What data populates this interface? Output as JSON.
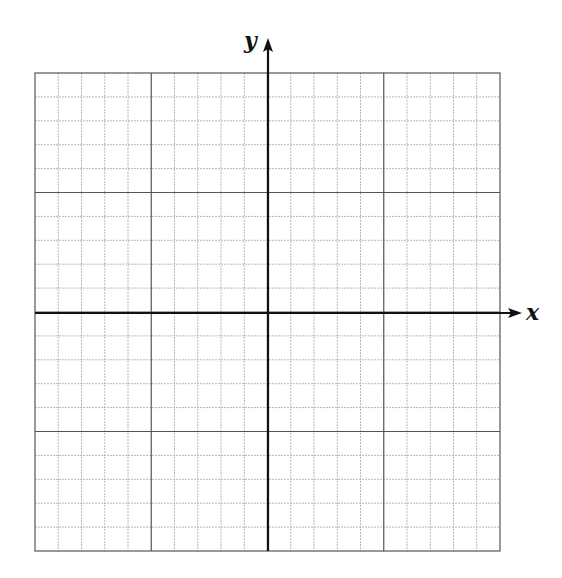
{
  "graph": {
    "x_label": "x",
    "y_label": "y",
    "grid": {
      "left": 35,
      "top": 73,
      "right": 500,
      "bottom": 551,
      "cells_x": 20,
      "cells_y": 20,
      "major_every": 5,
      "minor_color": "#b8b8b8",
      "major_color": "#555555",
      "axis_color": "#111111"
    },
    "origin": {
      "x": 268,
      "y": 313
    },
    "x_axis_end": 522,
    "y_axis_top": 38
  }
}
